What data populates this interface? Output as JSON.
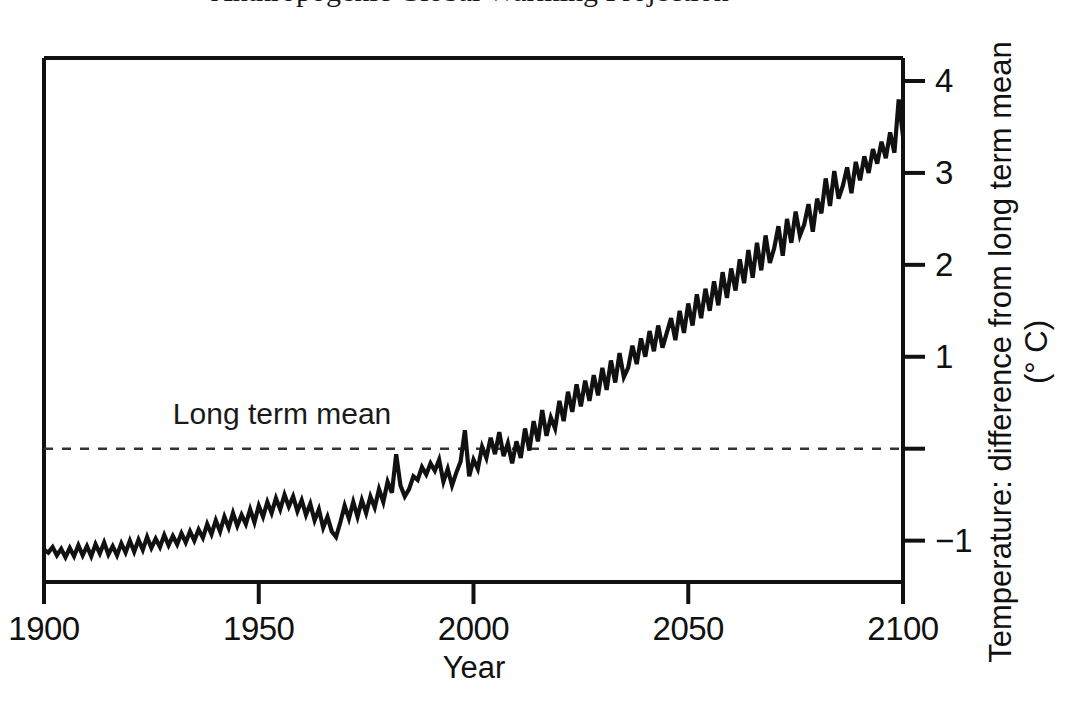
{
  "figure": {
    "title": "Anthropogenic Global Warming Projection",
    "title_clipped": true,
    "background": "#ffffff",
    "foreground": "#111111"
  },
  "annotations": [
    {
      "name": "long-term-mean-label",
      "text": "Long term mean",
      "x_year": 1930,
      "y_value": 0.35
    }
  ],
  "axes": {
    "x": {
      "title": "Year",
      "ticks": [
        "1900",
        "1950",
        "2000",
        "2050",
        "2100"
      ],
      "tick_values": [
        1900,
        1950,
        2000,
        2050,
        2100
      ],
      "range": [
        1900,
        2100
      ]
    },
    "y": {
      "title": "Temperature:  difference from long term mean",
      "unit": "(° C)",
      "ticks": [
        "4",
        "3",
        "2",
        "1",
        "",
        "−1"
      ],
      "tick_values": [
        4,
        3,
        2,
        1,
        0,
        -1
      ],
      "range": [
        -1.45,
        4.25
      ],
      "side": "right"
    }
  },
  "reference_line": {
    "name": "long-term-mean-line",
    "value": 0,
    "style": "dashed",
    "color": "#333333"
  },
  "chart_data": {
    "type": "line",
    "title": "Anthropogenic Global Warming Projection",
    "xlabel": "Year",
    "ylabel": "Temperature:  difference from long term mean (° C)",
    "xlim": [
      1900,
      2100
    ],
    "ylim": [
      -1.45,
      4.25
    ],
    "grid": false,
    "legend": "none",
    "line_color": "#111111",
    "line_width": 4,
    "series": [
      {
        "name": "Temperature anomaly",
        "x": [
          1900,
          1901,
          1902,
          1903,
          1904,
          1905,
          1906,
          1907,
          1908,
          1909,
          1910,
          1911,
          1912,
          1913,
          1914,
          1915,
          1916,
          1917,
          1918,
          1919,
          1920,
          1921,
          1922,
          1923,
          1924,
          1925,
          1926,
          1927,
          1928,
          1929,
          1930,
          1931,
          1932,
          1933,
          1934,
          1935,
          1936,
          1937,
          1938,
          1939,
          1940,
          1941,
          1942,
          1943,
          1944,
          1945,
          1946,
          1947,
          1948,
          1949,
          1950,
          1951,
          1952,
          1953,
          1954,
          1955,
          1956,
          1957,
          1958,
          1959,
          1960,
          1961,
          1962,
          1963,
          1964,
          1965,
          1966,
          1967,
          1968,
          1969,
          1970,
          1971,
          1972,
          1973,
          1974,
          1975,
          1976,
          1977,
          1978,
          1979,
          1980,
          1981,
          1982,
          1983,
          1984,
          1985,
          1986,
          1987,
          1988,
          1989,
          1990,
          1991,
          1992,
          1993,
          1994,
          1995,
          1996,
          1997,
          1998,
          1999,
          2000,
          2001,
          2002,
          2003,
          2004,
          2005,
          2006,
          2007,
          2008,
          2009,
          2010,
          2011,
          2012,
          2013,
          2014,
          2015,
          2016,
          2017,
          2018,
          2019,
          2020,
          2021,
          2022,
          2023,
          2024,
          2025,
          2026,
          2027,
          2028,
          2029,
          2030,
          2031,
          2032,
          2033,
          2034,
          2035,
          2036,
          2037,
          2038,
          2039,
          2040,
          2041,
          2042,
          2043,
          2044,
          2045,
          2046,
          2047,
          2048,
          2049,
          2050,
          2051,
          2052,
          2053,
          2054,
          2055,
          2056,
          2057,
          2058,
          2059,
          2060,
          2061,
          2062,
          2063,
          2064,
          2065,
          2066,
          2067,
          2068,
          2069,
          2070,
          2071,
          2072,
          2073,
          2074,
          2075,
          2076,
          2077,
          2078,
          2079,
          2080,
          2081,
          2082,
          2083,
          2084,
          2085,
          2086,
          2087,
          2088,
          2089,
          2090,
          2091,
          2092,
          2093,
          2094,
          2095,
          2096,
          2097,
          2098,
          2099,
          2100
        ],
        "y": [
          -1.1,
          -1.13,
          -1.07,
          -1.16,
          -1.09,
          -1.18,
          -1.08,
          -1.17,
          -1.05,
          -1.16,
          -1.06,
          -1.17,
          -1.04,
          -1.14,
          -1.02,
          -1.15,
          -1.06,
          -1.16,
          -1.03,
          -1.13,
          -1.0,
          -1.12,
          -0.99,
          -1.1,
          -0.96,
          -1.08,
          -0.98,
          -1.07,
          -0.94,
          -1.05,
          -0.95,
          -1.04,
          -0.92,
          -1.02,
          -0.9,
          -1.0,
          -0.88,
          -0.97,
          -0.82,
          -0.93,
          -0.78,
          -0.9,
          -0.74,
          -0.86,
          -0.7,
          -0.84,
          -0.72,
          -0.82,
          -0.66,
          -0.8,
          -0.62,
          -0.74,
          -0.58,
          -0.7,
          -0.54,
          -0.66,
          -0.5,
          -0.63,
          -0.52,
          -0.68,
          -0.56,
          -0.72,
          -0.6,
          -0.78,
          -0.66,
          -0.86,
          -0.74,
          -0.9,
          -0.96,
          -0.8,
          -0.62,
          -0.76,
          -0.58,
          -0.74,
          -0.56,
          -0.7,
          -0.52,
          -0.64,
          -0.44,
          -0.58,
          -0.36,
          -0.48,
          -0.06,
          -0.4,
          -0.52,
          -0.44,
          -0.3,
          -0.34,
          -0.2,
          -0.28,
          -0.16,
          -0.24,
          -0.12,
          -0.36,
          -0.22,
          -0.4,
          -0.26,
          -0.14,
          0.2,
          -0.3,
          -0.12,
          -0.22,
          0.02,
          -0.1,
          0.12,
          -0.06,
          0.18,
          -0.08,
          0.06,
          -0.16,
          0.08,
          -0.1,
          0.22,
          -0.02,
          0.3,
          0.08,
          0.42,
          0.14,
          0.34,
          0.22,
          0.52,
          0.3,
          0.62,
          0.4,
          0.7,
          0.46,
          0.74,
          0.52,
          0.8,
          0.58,
          0.88,
          0.64,
          0.96,
          0.72,
          1.04,
          0.78,
          0.88,
          1.12,
          0.92,
          1.2,
          1.0,
          1.28,
          1.06,
          1.34,
          1.1,
          1.26,
          1.42,
          1.18,
          1.5,
          1.26,
          1.58,
          1.34,
          1.68,
          1.42,
          1.74,
          1.5,
          1.82,
          1.56,
          1.92,
          1.64,
          1.96,
          1.72,
          2.06,
          1.8,
          2.16,
          1.86,
          2.24,
          1.94,
          2.32,
          2.02,
          2.18,
          2.42,
          2.1,
          2.5,
          2.24,
          2.58,
          2.32,
          2.44,
          2.66,
          2.36,
          2.72,
          2.56,
          2.94,
          2.64,
          3.02,
          2.72,
          2.86,
          3.06,
          2.78,
          3.12,
          2.92,
          3.18,
          3.0,
          3.26,
          3.1,
          3.34,
          3.16,
          3.44,
          3.22,
          3.8,
          3.4
        ]
      }
    ]
  }
}
